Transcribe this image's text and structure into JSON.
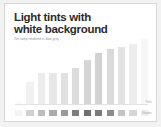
{
  "slide": {
    "title": "Light tints with\nwhite background",
    "subtitle": "Tint ramp rendered in dark grey",
    "axis_caption": "Tints",
    "swatch_caption": "Shades",
    "background_color": "#ffffff",
    "canvas_color": "#f2f2f2",
    "border_color": "#d8d8d8",
    "title_color": "#2b2b2b",
    "subtitle_color": "#8d8d8d",
    "caption_color": "#9a9a9a",
    "axis_color": "#e2e2e2"
  },
  "chart_data": {
    "type": "bar",
    "title": "Light tints with white background",
    "subtitle": "Tint ramp rendered in dark grey",
    "xlabel": "",
    "ylabel": "",
    "ylim": [
      0,
      100
    ],
    "grid": false,
    "legend": "none",
    "categories": [
      "1",
      "2",
      "3",
      "4",
      "5",
      "6",
      "7",
      "8",
      "9",
      "10",
      "11",
      "12"
    ],
    "values": [
      4,
      34,
      48,
      47,
      48,
      56,
      68,
      79,
      84,
      88,
      93,
      100
    ],
    "bar_colors": [
      "#fbfbfb",
      "#f1f1f1",
      "#ececec",
      "#e7e7e7",
      "#e1e1e1",
      "#dcdcdc",
      "#d6d6d6",
      "#d2d2d2",
      "#dadada",
      "#e3e3e3",
      "#ededed",
      "#f7f7f7"
    ],
    "swatch_colors": [
      "#f4f4f4",
      "#d0d0d0",
      "#bdbdbd",
      "#ababab",
      "#9a9a9a",
      "#7d7d7d",
      "#6e6e6e",
      "#7a7a7a",
      "#8c8c8c",
      "#c4c4c4",
      "#d6d6d6",
      "#efefef"
    ]
  }
}
